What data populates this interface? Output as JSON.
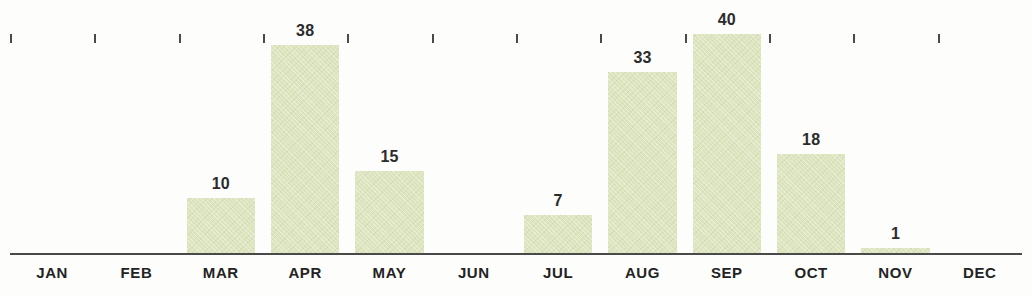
{
  "chart_data": {
    "type": "bar",
    "title": "",
    "subtitle": "",
    "xlabel": "",
    "ylabel": "",
    "categories": [
      "JAN",
      "FEB",
      "MAR",
      "APR",
      "MAY",
      "JUN",
      "JUL",
      "AUG",
      "SEP",
      "OCT",
      "NOV",
      "DEC"
    ],
    "values": [
      0,
      0,
      10,
      38,
      15,
      0,
      7,
      33,
      40,
      18,
      1,
      0
    ],
    "value_labels": [
      "",
      "",
      "10",
      "38",
      "15",
      "",
      "7",
      "33",
      "40",
      "18",
      "1",
      ""
    ],
    "ylim": [
      0,
      40
    ],
    "grid": false,
    "legend": false,
    "bar_color": "#dde5bf",
    "axis_color": "#4a4a48",
    "label_color": "#232323",
    "background_color": "#fdfdfb"
  }
}
